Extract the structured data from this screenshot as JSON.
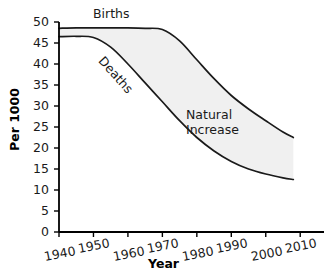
{
  "chart_data": {
    "type": "area",
    "title": "",
    "subtitle": "",
    "xlabel": "Year",
    "ylabel": "Per 1000",
    "xlim": [
      1940,
      2014
    ],
    "ylim": [
      0,
      50
    ],
    "xticks": [
      1940,
      1950,
      1960,
      1970,
      1980,
      1990,
      2000,
      2010
    ],
    "xtick_labels": [
      "1940",
      "1950",
      "1960",
      "1970",
      "1980",
      "1990",
      "2000",
      "2010"
    ],
    "yticks": [
      0,
      5,
      10,
      15,
      20,
      25,
      30,
      35,
      40,
      45,
      50
    ],
    "ytick_labels": [
      "0",
      "5",
      "10",
      "15",
      "20",
      "25",
      "30",
      "35",
      "40",
      "45",
      "50"
    ],
    "grid": false,
    "legend_position": "inline-curve-labels",
    "x": [
      1940,
      1945,
      1950,
      1955,
      1960,
      1965,
      1970,
      1975,
      1980,
      1985,
      1990,
      1995,
      2000,
      2005,
      2008
    ],
    "series": [
      {
        "name": "Births",
        "values": [
          48.5,
          48.6,
          48.6,
          48.6,
          48.6,
          48.5,
          48.2,
          45.5,
          41.0,
          36.5,
          32.5,
          29.3,
          26.5,
          23.8,
          22.5
        ]
      },
      {
        "name": "Deaths",
        "values": [
          46.5,
          46.6,
          46.3,
          44.0,
          40.0,
          35.5,
          31.0,
          26.5,
          22.5,
          19.3,
          16.8,
          15.0,
          13.8,
          12.9,
          12.5
        ]
      }
    ],
    "annotations": [
      {
        "text": "Births",
        "x": 1951,
        "y": 50.5,
        "rotation": 0
      },
      {
        "text": "Deaths",
        "x": 1956,
        "y": 38.0,
        "rotation": 48
      },
      {
        "text": "Natural Increase",
        "x": 1977,
        "y": 27.5,
        "rotation": 0
      }
    ],
    "band": {
      "label_line_1": "Natural",
      "label_line_2": "Increase",
      "upper_series": "Births",
      "lower_series": "Deaths"
    },
    "colors": {
      "axis": "#000000",
      "curve": "#1a1a1a",
      "band_fill": "#f0f0f0",
      "text": "#1a1a1a",
      "background": "#ffffff"
    }
  },
  "axes": {
    "y_title": "Per 1000",
    "x_title": "Year"
  }
}
